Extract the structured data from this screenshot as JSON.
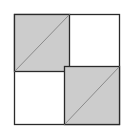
{
  "diagram": {
    "colors": {
      "shade": "#cccccc",
      "stroke": "#2a2a2a",
      "diagonal": "#8a8a8a",
      "background": "#ffffff"
    },
    "regions": [
      {
        "name": "top-left-square",
        "shaded": true,
        "diagonal": "bottom-left-to-top-right"
      },
      {
        "name": "top-right-square",
        "shaded": false
      },
      {
        "name": "bottom-left-square",
        "shaded": false
      },
      {
        "name": "bottom-right-square",
        "shaded": true,
        "diagonal": "bottom-left-to-top-right"
      }
    ]
  }
}
